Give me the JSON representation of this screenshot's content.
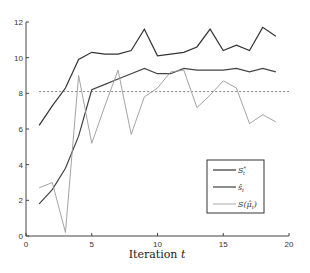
{
  "chart_data": {
    "type": "line",
    "title": "",
    "xlabel": "Iteration t",
    "ylabel": "",
    "xlim": [
      0,
      20
    ],
    "ylim": [
      0,
      12
    ],
    "xticks": [
      0,
      5,
      10,
      15,
      20
    ],
    "yticks": [
      0,
      2,
      4,
      6,
      8,
      10,
      12
    ],
    "grid": false,
    "legend_position": "lower right",
    "x": [
      1,
      2,
      3,
      4,
      5,
      6,
      7,
      8,
      9,
      10,
      11,
      12,
      13,
      14,
      15,
      16,
      17,
      18,
      19
    ],
    "series": [
      {
        "name": "S*_t",
        "style": "solid",
        "color": "#333333",
        "values": [
          6.2,
          7.3,
          8.3,
          9.9,
          10.3,
          10.2,
          10.2,
          10.4,
          11.6,
          10.1,
          10.2,
          10.3,
          10.6,
          11.6,
          10.4,
          10.7,
          10.4,
          11.7,
          11.2
        ]
      },
      {
        "name": "ŝ_t",
        "style": "solid",
        "color": "#444444",
        "values": [
          1.8,
          2.6,
          3.8,
          5.6,
          8.2,
          8.5,
          8.8,
          9.1,
          9.4,
          9.1,
          9.1,
          9.4,
          9.3,
          9.3,
          9.3,
          9.4,
          9.2,
          9.4,
          9.2
        ]
      },
      {
        "name": "S(μ̂_t)",
        "style": "solid",
        "color": "#999999",
        "values": [
          2.7,
          3.0,
          0.2,
          9.0,
          5.2,
          7.3,
          9.3,
          5.7,
          7.8,
          8.3,
          9.2,
          9.3,
          7.2,
          7.9,
          8.7,
          8.3,
          6.3,
          6.8,
          6.4
        ]
      }
    ],
    "reference_lines": [
      {
        "orientation": "horizontal",
        "y": 8.1,
        "x_from": 1,
        "x_to": 20,
        "style": "dotted",
        "color": "#888888"
      }
    ],
    "legend": [
      {
        "label": "S*_t",
        "color": "#333333"
      },
      {
        "label": "ŝ_t",
        "color": "#444444"
      },
      {
        "label": "S(μ̂_t)",
        "color": "#999999"
      }
    ]
  },
  "labels": {
    "xlabel_main": "Iteration ",
    "xlabel_var": "t",
    "legend_s_star": "S",
    "legend_s_star_sup": "*",
    "legend_s_star_sub": "t",
    "legend_s_hat": "ŝ",
    "legend_s_hat_sub": "t",
    "legend_s_mu": "S(μ̂",
    "legend_s_mu_sub": "t",
    "legend_s_mu_close": ")"
  }
}
